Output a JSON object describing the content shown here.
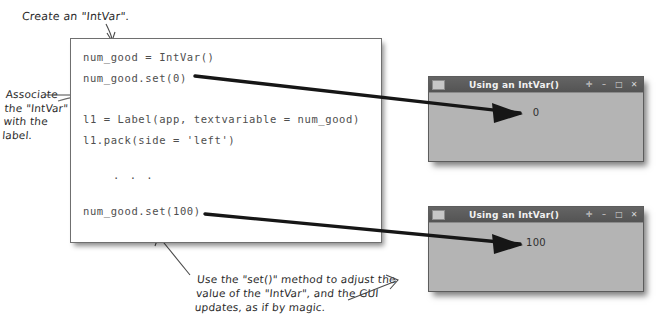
{
  "code": {
    "lines": [
      {
        "text": "num_good = IntVar()",
        "x": 12,
        "y": 12
      },
      {
        "text": "num_good.set(0)",
        "x": 12,
        "y": 33
      },
      {
        "text": "l1 = Label(app, textvariable = num_good)",
        "x": 12,
        "y": 74
      },
      {
        "text": "l1.pack(side = 'left')",
        "x": 12,
        "y": 95
      },
      {
        "text": ". . .",
        "x": 42,
        "y": 130
      },
      {
        "text": "num_good.set(100)",
        "x": 12,
        "y": 166
      }
    ]
  },
  "annotations": {
    "create": {
      "lines": [
        "Create an \"IntVar\"."
      ]
    },
    "associate": {
      "lines": [
        "Associate",
        "the \"IntVar\"",
        "with the",
        "label."
      ]
    },
    "setmethod": {
      "lines": [
        "Use the \"set()\" method to adjust the",
        "value of the \"IntVar\", and the GUI",
        "updates, as if by magic."
      ]
    }
  },
  "windows": [
    {
      "title": "Using an IntVar()",
      "value": "0",
      "buttons": [
        "pin-icon",
        "minimize-icon",
        "maximize-icon",
        "close-icon"
      ],
      "button_glyphs": [
        "✛",
        "–",
        "□",
        "✕"
      ]
    },
    {
      "title": "Using an IntVar()",
      "value": "100",
      "buttons": [
        "pin-icon",
        "minimize-icon",
        "maximize-icon",
        "close-icon"
      ],
      "button_glyphs": [
        "✛",
        "–",
        "□",
        "✕"
      ]
    }
  ],
  "colors": {
    "ink": "#2b2b2b",
    "code_text": "#4e4e4e",
    "window_titlebar": "#5a5a5a",
    "window_body": "#b4b4b4",
    "arrow": "#1a1a1a"
  }
}
